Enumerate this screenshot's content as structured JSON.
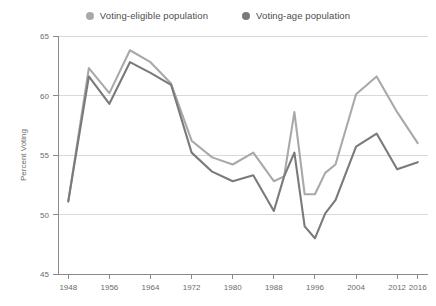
{
  "legend": {
    "position": "top-center",
    "entries": [
      {
        "label": "Voting-eligible population",
        "color": "#a9a9a9",
        "icon": "legend-dot-icon"
      },
      {
        "label": "Voting-age population",
        "color": "#7a7a7a",
        "icon": "legend-dot-icon"
      }
    ]
  },
  "chart_data": {
    "type": "line",
    "title": "",
    "subtitle": "",
    "xlabel": "",
    "ylabel": "Percent Voting",
    "xlim": [
      1946,
      2018
    ],
    "ylim": [
      45,
      65
    ],
    "yticks": [
      45,
      50,
      55,
      60,
      65
    ],
    "xticks": [
      1948,
      1956,
      1964,
      1972,
      1980,
      1988,
      1996,
      2004,
      2012,
      2016
    ],
    "grid": "horizontal",
    "x": [
      1948,
      1952,
      1956,
      1960,
      1964,
      1968,
      1972,
      1976,
      1980,
      1984,
      1988,
      1990,
      1992,
      1994,
      1996,
      1998,
      2000,
      2004,
      2008,
      2012,
      2016
    ],
    "series": [
      {
        "name": "Voting-eligible population",
        "color": "#a9a9a9",
        "values": [
          51.1,
          62.3,
          60.2,
          63.8,
          62.8,
          61.0,
          56.2,
          54.8,
          54.2,
          55.2,
          52.8,
          53.2,
          58.6,
          51.7,
          51.7,
          53.5,
          54.2,
          60.1,
          61.6,
          58.6,
          56.0
        ]
      },
      {
        "name": "Voting-age population",
        "color": "#7a7a7a",
        "values": [
          51.1,
          61.6,
          59.3,
          62.8,
          61.9,
          60.9,
          55.2,
          53.6,
          52.8,
          53.3,
          50.3,
          53.2,
          55.2,
          49.0,
          48.0,
          50.1,
          51.2,
          55.7,
          56.8,
          53.8,
          54.4
        ]
      }
    ]
  },
  "axes": {
    "y_tick_labels": [
      "65",
      "60",
      "55",
      "50",
      "45"
    ],
    "x_tick_labels": [
      "1948",
      "1956",
      "1964",
      "1972",
      "1980",
      "1988",
      "1996",
      "2004",
      "2012",
      "2016"
    ],
    "y_axis_title": "Percent Voting"
  },
  "colors": {
    "background": "#ffffff",
    "grid": "#d9d9d9",
    "axis": "#8a8a8a",
    "text": "#6b6b6b",
    "series_light": "#a9a9a9",
    "series_dark": "#7a7a7a"
  }
}
